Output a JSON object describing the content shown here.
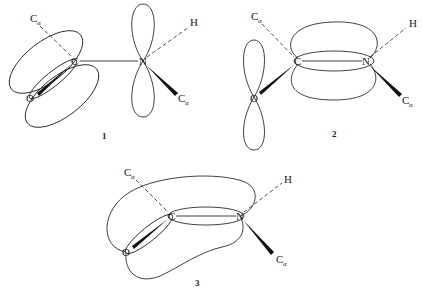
{
  "figure": {
    "panels": [
      {
        "label": "1",
        "description": "C=O pi bond localized; nitrogen lone pair in p orbital",
        "atoms": {
          "carbon": "C",
          "nitrogen": "N",
          "oxygen": "O",
          "hydrogen": "H",
          "calpha_main": "C",
          "calpha_sub": "α",
          "calpha_n_main": "C",
          "calpha_n_sub": "α"
        }
      },
      {
        "label": "2",
        "description": "C=N pi bond; oxygen lone pair in p orbital",
        "atoms": {
          "carbon": "C",
          "nitrogen": "N",
          "oxygen": "O",
          "hydrogen": "H",
          "calpha_main": "C",
          "calpha_sub": "α",
          "calpha_n_main": "C",
          "calpha_n_sub": "α"
        }
      },
      {
        "label": "3",
        "description": "Delocalized pi system over O, C and N",
        "atoms": {
          "carbon": "C",
          "nitrogen": "N",
          "oxygen": "O",
          "hydrogen": "H",
          "calpha_main": "C",
          "calpha_sub": "α",
          "calpha_n_main": "C",
          "calpha_n_sub": "α"
        }
      }
    ]
  },
  "colors": {
    "line": "#2a2a2a",
    "wedge": "#111111",
    "background": "#ffffff"
  }
}
